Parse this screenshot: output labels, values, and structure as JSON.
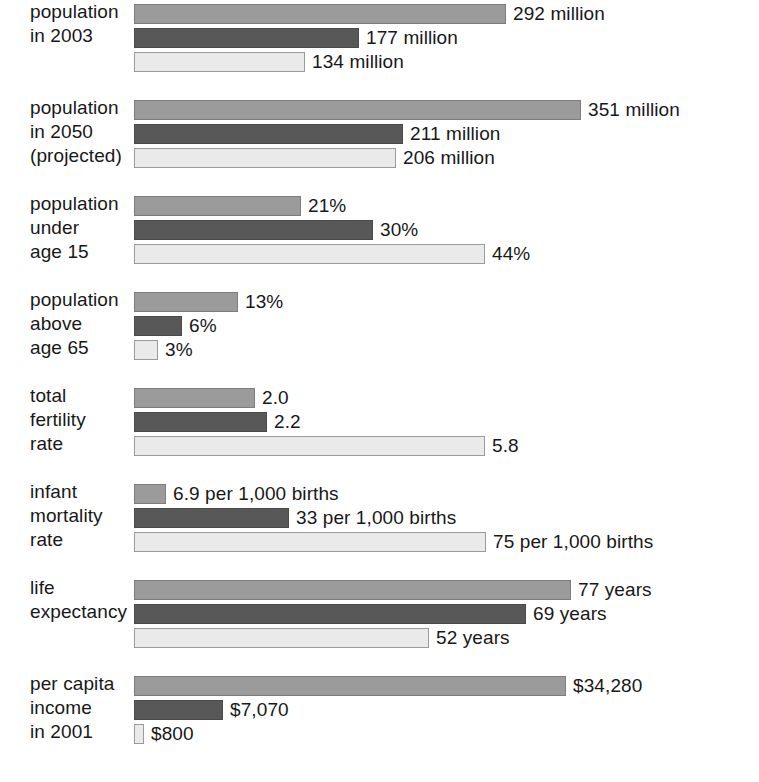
{
  "chart_data": {
    "type": "bar",
    "orientation": "horizontal",
    "title": "",
    "subtitle": "",
    "xlabel": "",
    "ylabel": "",
    "grid": false,
    "legend_position": "none",
    "series": [
      {
        "name": "series-1",
        "color": "#9b9b9b"
      },
      {
        "name": "series-2",
        "color": "#585858"
      },
      {
        "name": "series-3",
        "color": "#eaeaea"
      }
    ],
    "categories": [
      "population in 2003",
      "population in 2050 (projected)",
      "population under age 15",
      "population above age 65",
      "total fertility rate",
      "infant mortality rate",
      "life expectancy",
      "per capita income in 2001"
    ],
    "groups": [
      {
        "label": "population\nin 2003",
        "unit": "million",
        "axis_max": 360,
        "bars": [
          {
            "value": 292,
            "label": "292 million",
            "width_px": 372
          },
          {
            "value": 177,
            "label": "177 million",
            "width_px": 225
          },
          {
            "value": 134,
            "label": "134 million",
            "width_px": 171
          }
        ]
      },
      {
        "label": "population\nin 2050\n(projected)",
        "unit": "million",
        "axis_max": 360,
        "bars": [
          {
            "value": 351,
            "label": "351 million",
            "width_px": 447
          },
          {
            "value": 211,
            "label": "211 million",
            "width_px": 269
          },
          {
            "value": 206,
            "label": "206 million",
            "width_px": 262
          }
        ]
      },
      {
        "label": "population\nunder\nage 15",
        "unit": "%",
        "axis_max": 46,
        "bars": [
          {
            "value": 21,
            "label": "21%",
            "width_px": 167
          },
          {
            "value": 30,
            "label": "30%",
            "width_px": 239
          },
          {
            "value": 44,
            "label": "44%",
            "width_px": 351
          }
        ]
      },
      {
        "label": "population\nabove\nage 65",
        "unit": "%",
        "axis_max": 46,
        "bars": [
          {
            "value": 13,
            "label": "13%",
            "width_px": 104
          },
          {
            "value": 6,
            "label": "6%",
            "width_px": 48
          },
          {
            "value": 3,
            "label": "3%",
            "width_px": 24
          }
        ]
      },
      {
        "label": "total\nfertility\nrate",
        "unit": "children per woman",
        "axis_max": 6,
        "bars": [
          {
            "value": 2.0,
            "label": "2.0",
            "width_px": 121
          },
          {
            "value": 2.2,
            "label": "2.2",
            "width_px": 133
          },
          {
            "value": 5.8,
            "label": "5.8",
            "width_px": 351
          }
        ]
      },
      {
        "label": "infant\nmortality\nrate",
        "unit": "per 1,000 births",
        "axis_max": 78,
        "bars": [
          {
            "value": 6.9,
            "label": "6.9 per 1,000 births",
            "width_px": 32
          },
          {
            "value": 33,
            "label": "33 per 1,000 births",
            "width_px": 155
          },
          {
            "value": 75,
            "label": "75 per 1,000 births",
            "width_px": 352
          }
        ]
      },
      {
        "label": "life\nexpectancy",
        "unit": "years",
        "axis_max": 80,
        "bars": [
          {
            "value": 77,
            "label": "77 years",
            "width_px": 437
          },
          {
            "value": 69,
            "label": "69 years",
            "width_px": 392
          },
          {
            "value": 52,
            "label": "52 years",
            "width_px": 295
          }
        ]
      },
      {
        "label": "per capita\nincome\nin 2001",
        "unit": "USD",
        "axis_max": 35500,
        "bars": [
          {
            "value": 34280,
            "label": "$34,280",
            "width_px": 432
          },
          {
            "value": 7070,
            "label": "$7,070",
            "width_px": 89
          },
          {
            "value": 800,
            "label": "$800",
            "width_px": 10
          }
        ]
      }
    ]
  }
}
